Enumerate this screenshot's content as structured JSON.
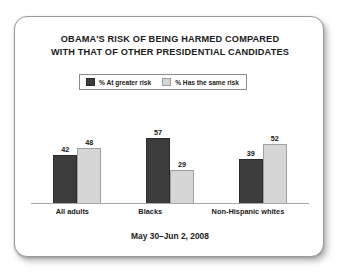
{
  "card": {
    "title_lines": [
      "OBAMA'S RISK OF BEING HARMED COMPARED",
      "WITH THAT OF OTHER PRESIDENTIAL CANDIDATES"
    ],
    "footer": "May 30–Jun 2, 2008"
  },
  "colors": {
    "series_at_greater_risk": "#3c3c3c",
    "series_same_risk": "#d6d6d6",
    "text": "#1b1b1b",
    "axis": "#a8a8a8",
    "card_border": "#9a9a9a",
    "background": "#ffffff"
  },
  "chart_data": {
    "type": "bar",
    "title": "OBAMA'S RISK OF BEING HARMED COMPARED WITH THAT OF OTHER PRESIDENTIAL CANDIDATES",
    "subtitle": "May 30–Jun 2, 2008",
    "categories": [
      "All adults",
      "Blacks",
      "Non-Hispanic whites"
    ],
    "series": [
      {
        "name": "% At greater risk",
        "values": [
          42,
          57,
          39
        ],
        "color": "#3c3c3c"
      },
      {
        "name": "% Has the same risk",
        "values": [
          48,
          29,
          52
        ],
        "color": "#d6d6d6"
      }
    ],
    "xlabel": "",
    "ylabel": "",
    "ylim": [
      0,
      70
    ],
    "grid": false,
    "legend_position": "top-center",
    "data_labels": true,
    "groups": [
      {
        "category": "All adults",
        "bars": [
          {
            "series": "% At greater risk",
            "value": 42
          },
          {
            "series": "% Has the same risk",
            "value": 48
          }
        ]
      },
      {
        "category": "Blacks",
        "bars": [
          {
            "series": "% At greater risk",
            "value": 57
          },
          {
            "series": "% Has the same risk",
            "value": 29
          }
        ]
      },
      {
        "category": "Non-Hispanic whites",
        "bars": [
          {
            "series": "% At greater risk",
            "value": 39
          },
          {
            "series": "% Has the same risk",
            "value": 52
          }
        ]
      }
    ]
  }
}
